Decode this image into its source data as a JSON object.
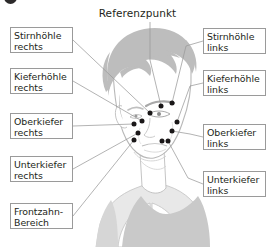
{
  "figure": {
    "marker_icon": "filled-circle-marker",
    "title": "Referenzpunkt",
    "illustration": "head-three-quarter-view-line-art",
    "colors": {
      "box_border": "#9a9a9a",
      "text": "#231f20",
      "leader_line": "#9a9a9a",
      "marker_dot": "#1a1718",
      "artwork_line": "#b8b8b8",
      "shirt_fill": "#c9c9c9",
      "hair_fill": "#bdbdbd"
    }
  },
  "labels_left": [
    {
      "id": "stirnhoehle-rechts",
      "line1": "Stirnhöhle",
      "line2": "rechts"
    },
    {
      "id": "kieferhoehle-rechts",
      "line1": "Kieferhöhle",
      "line2": "rechts"
    },
    {
      "id": "oberkiefer-rechts",
      "line1": "Oberkiefer",
      "line2": "rechts"
    },
    {
      "id": "unterkiefer-rechts",
      "line1": "Unterkiefer",
      "line2": "rechts"
    },
    {
      "id": "frontzahn-bereich",
      "line1": "Frontzahn-",
      "line2": "Bereich"
    }
  ],
  "labels_right": [
    {
      "id": "stirnhoehle-links",
      "line1": "Stirnhöhle",
      "line2": "links"
    },
    {
      "id": "kieferhoehle-links",
      "line1": "Kieferhöhle",
      "line2": "links"
    },
    {
      "id": "oberkiefer-links",
      "line1": "Oberkiefer",
      "line2": "links"
    },
    {
      "id": "unterkiefer-links",
      "line1": "Unterkiefer",
      "line2": "links"
    }
  ],
  "marker_points": [
    {
      "id": "referenzpunkt",
      "x": 161,
      "y": 106
    },
    {
      "id": "stirnhoehle-links",
      "x": 172,
      "y": 103
    },
    {
      "id": "kieferhoehle-links",
      "x": 177,
      "y": 122
    },
    {
      "id": "oberkiefer-links",
      "x": 172,
      "y": 131
    },
    {
      "id": "unterkiefer-links",
      "x": 168,
      "y": 141
    },
    {
      "id": "unterkiefer-links-2",
      "x": 162,
      "y": 141
    },
    {
      "id": "stirnhoehle-rechts",
      "x": 150,
      "y": 113
    },
    {
      "id": "kieferhoehle-rechts",
      "x": 142,
      "y": 121
    },
    {
      "id": "oberkiefer-rechts",
      "x": 134,
      "y": 124
    },
    {
      "id": "unterkiefer-rechts",
      "x": 138,
      "y": 133
    },
    {
      "id": "frontzahn-bereich",
      "x": 134,
      "y": 140
    }
  ]
}
